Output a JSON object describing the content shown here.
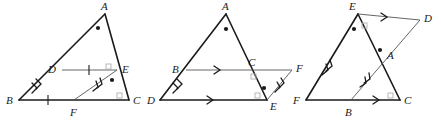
{
  "figure": {
    "background_color": "#ffffff",
    "stroke_color": "#1a1a1a",
    "light_stroke_color": "#777777",
    "marker_color": "#1a1a1a",
    "square_marker_color": "#b0b0b0",
    "panel_count": 3
  },
  "panels": [
    {
      "id": "panel-1",
      "name": "triangle-abc-with-midsegment-de",
      "vertices": [
        {
          "label": "A",
          "x": 105,
          "y": 14,
          "lx": 101,
          "ly": 10
        },
        {
          "label": "B",
          "x": 19,
          "y": 100,
          "lx": 8,
          "ly": 103
        },
        {
          "label": "C",
          "x": 129,
          "y": 100,
          "lx": 133,
          "ly": 103
        },
        {
          "label": "D",
          "x": 62,
          "y": 70,
          "lx": 50,
          "ly": 72
        },
        {
          "label": "E",
          "x": 117,
          "y": 70,
          "lx": 121,
          "ly": 72
        },
        {
          "label": "F",
          "x": 74,
          "y": 100,
          "lx": 70,
          "ly": 114
        }
      ],
      "segments": [
        {
          "name": "side-ab",
          "from": "A",
          "to": "B",
          "weight": "heavy"
        },
        {
          "name": "side-ac",
          "from": "A",
          "to": "C",
          "weight": "heavy"
        },
        {
          "name": "side-bc",
          "from": "B",
          "to": "C",
          "weight": "heavy"
        },
        {
          "name": "segment-de",
          "from": "D",
          "to": "E",
          "weight": "light"
        },
        {
          "name": "segment-fe",
          "from": "F",
          "to": "E",
          "weight": "light"
        }
      ],
      "tick_marks": [
        {
          "on": "segment-de",
          "count": 1
        },
        {
          "on": "segment-bf",
          "count": 1
        }
      ],
      "arrow_marks": [
        {
          "on": "side-bd",
          "count": 2
        },
        {
          "on": "segment-fe",
          "count": 2
        }
      ],
      "angle_dots": [
        "A",
        "E-interior"
      ],
      "right_angle_squares": [
        "E",
        "C"
      ]
    },
    {
      "id": "panel-2",
      "name": "triangle-ade-with-parallel-bc-and-cf",
      "vertices": [
        {
          "label": "A",
          "x": 226,
          "y": 14,
          "lx": 222,
          "ly": 10
        },
        {
          "label": "B",
          "x": 186,
          "y": 70,
          "lx": 174,
          "ly": 72
        },
        {
          "label": "C",
          "x": 253,
          "y": 70,
          "lx": 249,
          "ly": 64
        },
        {
          "label": "D",
          "x": 160,
          "y": 100,
          "lx": 149,
          "ly": 103
        },
        {
          "label": "E",
          "x": 267,
          "y": 100,
          "lx": 271,
          "ly": 106
        },
        {
          "label": "F",
          "x": 292,
          "y": 72,
          "lx": 296,
          "ly": 70
        }
      ],
      "segments": [
        {
          "name": "side-ad",
          "from": "A",
          "to": "D",
          "weight": "heavy"
        },
        {
          "name": "side-ae",
          "from": "A",
          "to": "E",
          "weight": "heavy"
        },
        {
          "name": "side-de",
          "from": "D",
          "to": "E",
          "weight": "heavy"
        },
        {
          "name": "segment-bc",
          "from": "B",
          "to": "C",
          "weight": "light"
        },
        {
          "name": "segment-cf",
          "from": "C",
          "to": "F",
          "weight": "light"
        },
        {
          "name": "segment-ef",
          "from": "E",
          "to": "F",
          "weight": "light"
        }
      ],
      "arrow_marks": [
        {
          "on": "segment-bc",
          "count": 1
        },
        {
          "on": "segment-de",
          "count": 1
        },
        {
          "on": "side-bd",
          "count": 2
        },
        {
          "on": "segment-ef",
          "count": 2
        }
      ],
      "angle_dots": [
        "A",
        "E-interior"
      ],
      "right_angle_squares": [
        "C",
        "E"
      ]
    },
    {
      "id": "panel-3",
      "name": "triangle-efc-with-cevian-ea-and-parallel-ed",
      "vertices": [
        {
          "label": "E",
          "x": 358,
          "y": 14,
          "lx": 350,
          "ly": 10
        },
        {
          "label": "D",
          "x": 420,
          "y": 20,
          "lx": 424,
          "ly": 19
        },
        {
          "label": "F",
          "x": 306,
          "y": 100,
          "lx": 295,
          "ly": 103
        },
        {
          "label": "C",
          "x": 400,
          "y": 100,
          "lx": 404,
          "ly": 103
        },
        {
          "label": "B",
          "x": 351,
          "y": 100,
          "lx": 346,
          "ly": 114
        },
        {
          "label": "A",
          "x": 384,
          "y": 56,
          "lx": 388,
          "ly": 56
        }
      ],
      "segments": [
        {
          "name": "side-ef",
          "from": "E",
          "to": "F",
          "weight": "heavy"
        },
        {
          "name": "side-ec",
          "from": "E",
          "to": "C",
          "weight": "heavy"
        },
        {
          "name": "side-fc",
          "from": "F",
          "to": "C",
          "weight": "heavy"
        },
        {
          "name": "segment-ed",
          "from": "E",
          "to": "D",
          "weight": "light"
        },
        {
          "name": "segment-bd",
          "from": "B",
          "to": "D",
          "weight": "light"
        }
      ],
      "arrow_marks": [
        {
          "on": "segment-ed",
          "count": 1
        },
        {
          "on": "segment-bc",
          "count": 1
        },
        {
          "on": "side-fe",
          "count": 2
        },
        {
          "on": "segment-ba",
          "count": 2
        }
      ],
      "angle_dots": [
        "E",
        "A"
      ],
      "right_angle_squares": [
        "E-upper",
        "C"
      ]
    }
  ]
}
